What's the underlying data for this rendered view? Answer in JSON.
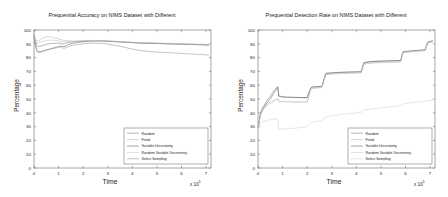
{
  "figure": {
    "background_color": "#ffffff",
    "panel_count": 2
  },
  "chart_data": [
    {
      "type": "line",
      "panel": "left",
      "title": "Prequential Accuracy on NIMS Dataset with Different\nBudgeting Strategies (Naive Bayes, 10% Budget)",
      "title_line1": "Prequential Accuracy on NIMS Dataset with Different",
      "title_line2": "Budgeting Strategies (Naive Bayes, 10% Budget)",
      "xlabel": "Time",
      "ylabel": "Percentage",
      "x_multiplier": "x 10",
      "x_exponent": "5",
      "xlim": [
        0,
        7.2
      ],
      "ylim": [
        0,
        100
      ],
      "xticks": [
        0,
        1,
        2,
        3,
        4,
        5,
        6,
        7
      ],
      "yticks": [
        0,
        10,
        20,
        30,
        40,
        50,
        60,
        70,
        80,
        90,
        100
      ],
      "grid": false,
      "legend_position": "lower right",
      "legend_labels": [
        "Random",
        "Fixed",
        "Variable Uncertainty",
        "Random Variable Uncertainty",
        "Select Sampling"
      ],
      "x": [
        0,
        0.05,
        0.1,
        0.15,
        0.2,
        0.3,
        0.4,
        0.5,
        0.6,
        0.7,
        0.8,
        0.9,
        1.0,
        1.1,
        1.2,
        1.3,
        1.4,
        1.5,
        1.6,
        1.8,
        2.0,
        2.2,
        2.4,
        2.6,
        2.8,
        3.0,
        3.2,
        3.4,
        3.6,
        3.8,
        4.0,
        4.2,
        4.4,
        4.6,
        4.8,
        5.0,
        5.2,
        5.4,
        5.6,
        5.8,
        6.0,
        6.2,
        6.4,
        6.6,
        6.8,
        7.0,
        7.1
      ],
      "series": [
        {
          "name": "Random",
          "color": "#8a8a8a",
          "values": [
            97,
            92,
            89,
            88,
            88,
            88.5,
            89,
            89.5,
            90,
            90.2,
            90.3,
            90.4,
            90.5,
            90.2,
            89.8,
            90.5,
            91,
            91.3,
            91.5,
            91.8,
            92,
            92.2,
            92.3,
            92.2,
            92,
            91.8,
            91.6,
            91.4,
            91.2,
            91,
            90.8,
            90.6,
            90.5,
            90.4,
            90.3,
            90.2,
            90.1,
            90,
            89.9,
            89.8,
            89.7,
            89.6,
            89.5,
            89.4,
            89.3,
            89.2,
            89.1
          ]
        },
        {
          "name": "Fixed",
          "color": "#bdbdbd",
          "values": [
            97,
            94,
            92.5,
            92,
            92.2,
            93.5,
            94.5,
            95,
            95.2,
            95,
            94.5,
            94,
            93.5,
            93,
            92.5,
            92.2,
            92,
            91.8,
            91.7,
            91.8,
            92,
            92.2,
            92.3,
            92.2,
            92.1,
            92,
            91.8,
            91.6,
            91.4,
            91.2,
            91,
            90.8,
            90.6,
            90.5,
            90.4,
            90.3,
            90.2,
            90.1,
            90,
            89.9,
            89.8,
            89.7,
            89.6,
            89.5,
            89.4,
            89.3,
            89.2
          ]
        },
        {
          "name": "Variable Uncertainty",
          "color": "#6e6e6e",
          "values": [
            96,
            90,
            86,
            84.5,
            84.2,
            84.5,
            85,
            85.5,
            86,
            86.5,
            87,
            87.5,
            88,
            88.3,
            87.8,
            88.5,
            89.5,
            90,
            90.5,
            91,
            91.5,
            91.8,
            92,
            92.1,
            92,
            91.9,
            91.7,
            91.5,
            91.3,
            91.1,
            90.9,
            90.7,
            90.6,
            90.5,
            90.4,
            90.3,
            90.2,
            90.1,
            90,
            89.9,
            89.8,
            89.7,
            89.6,
            89.5,
            89.4,
            89.3,
            89.2
          ]
        },
        {
          "name": "Random Variable Uncertainty",
          "color": "#c9c9c9",
          "values": [
            97,
            93,
            91,
            90.5,
            90.8,
            91.5,
            92,
            92.3,
            92.5,
            92.6,
            92.5,
            92.4,
            92.2,
            91.8,
            91.2,
            91.5,
            91.8,
            92,
            92.1,
            92.2,
            92.3,
            92.4,
            92.4,
            92.3,
            92.2,
            92.1,
            92,
            91.8,
            91.6,
            91.4,
            91.2,
            91,
            90.9,
            90.8,
            90.7,
            90.6,
            90.5,
            90.4,
            90.3,
            90.2,
            90.1,
            90,
            89.9,
            89.8,
            89.7,
            89.6,
            89.5
          ]
        },
        {
          "name": "Select Sampling",
          "color": "#9e9e9e",
          "values": [
            96,
            90,
            85.5,
            84,
            83.8,
            84.2,
            84.8,
            85.3,
            85.8,
            86.2,
            86.6,
            87,
            87.4,
            87.8,
            86.5,
            87.2,
            88,
            88.5,
            89,
            89.5,
            90,
            90.3,
            90.5,
            90.4,
            90.2,
            89.8,
            89.2,
            88.5,
            87.8,
            87,
            86.2,
            85.5,
            85,
            84.6,
            84.3,
            84,
            83.8,
            83.6,
            83.4,
            83.2,
            83,
            82.8,
            82.6,
            82.4,
            82.2,
            82,
            81.9
          ]
        }
      ]
    },
    {
      "type": "line",
      "panel": "right",
      "title": "Prequential Detection Rate on NIMS Dataset with Different\nBudgeting Strategies (Naive Bayes, 10% Budget)",
      "title_line1": "Prequential Detection Rate on NIMS Dataset with Different",
      "title_line2": "Budgeting Strategies (Naive Bayes, 10% Budget)",
      "xlabel": "Time",
      "ylabel": "Percentage",
      "x_multiplier": "x 10",
      "x_exponent": "5",
      "xlim": [
        0,
        7.2
      ],
      "ylim": [
        0,
        100
      ],
      "xticks": [
        0,
        1,
        2,
        3,
        4,
        5,
        6,
        7
      ],
      "yticks": [
        0,
        10,
        20,
        30,
        40,
        50,
        60,
        70,
        80,
        90,
        100
      ],
      "grid": false,
      "legend_position": "lower right",
      "legend_labels": [
        "Random",
        "Fixed",
        "Variable Uncertainty",
        "Random Variable Uncertainty",
        "Select Sampling"
      ],
      "x": [
        0,
        0.1,
        0.2,
        0.3,
        0.4,
        0.5,
        0.6,
        0.7,
        0.8,
        0.85,
        0.9,
        1.0,
        1.2,
        1.4,
        1.6,
        1.8,
        2.0,
        2.15,
        2.2,
        2.4,
        2.6,
        2.75,
        2.8,
        3.0,
        3.2,
        3.4,
        3.6,
        3.8,
        4.0,
        4.2,
        4.3,
        4.4,
        4.6,
        4.8,
        5.0,
        5.2,
        5.4,
        5.6,
        5.8,
        5.9,
        6.0,
        6.2,
        6.4,
        6.6,
        6.8,
        6.9,
        7.0,
        7.1
      ],
      "series": [
        {
          "name": "Random",
          "color": "#8a8a8a",
          "values": [
            29,
            40,
            44,
            47,
            50,
            52,
            55,
            57,
            59,
            52,
            52,
            51.5,
            51.3,
            51.2,
            51.1,
            51,
            51,
            58,
            58.5,
            58.8,
            59,
            68,
            68.5,
            68.8,
            69,
            69.2,
            69.3,
            69.4,
            69.5,
            69.6,
            76,
            76.5,
            77,
            77.2,
            77.4,
            77.5,
            77.6,
            77.7,
            77.8,
            84,
            84.3,
            84.6,
            84.9,
            85.2,
            85.5,
            91,
            91.5,
            92
          ]
        },
        {
          "name": "Fixed",
          "color": "#bdbdbd",
          "values": [
            29,
            38,
            42,
            44,
            46,
            47,
            48,
            49,
            50,
            48,
            48,
            48,
            48,
            47.8,
            47.8,
            47.8,
            47.8,
            57,
            57.5,
            58,
            58.3,
            67,
            67.5,
            68,
            68.3,
            68.5,
            68.6,
            68.7,
            68.8,
            68.9,
            75,
            75.5,
            76,
            76.2,
            76.4,
            76.5,
            76.6,
            76.7,
            76.8,
            83.5,
            83.8,
            84.1,
            84.4,
            84.7,
            85,
            90.5,
            91,
            91.5
          ]
        },
        {
          "name": "Variable Uncertainty",
          "color": "#6e6e6e",
          "values": [
            29,
            39,
            43,
            45.5,
            48,
            50,
            53,
            56,
            58.5,
            52,
            52,
            51.5,
            51.3,
            51.2,
            51.1,
            51,
            51,
            58.2,
            58.7,
            59,
            59.2,
            68.2,
            68.7,
            69,
            69.2,
            69.4,
            69.5,
            69.6,
            69.7,
            69.8,
            76.2,
            76.7,
            77.1,
            77.3,
            77.5,
            77.6,
            77.7,
            77.8,
            77.9,
            84.2,
            84.5,
            84.8,
            85.1,
            85.4,
            85.7,
            91.2,
            91.7,
            92.2
          ]
        },
        {
          "name": "Random Variable Uncertainty",
          "color": "#c9c9c9",
          "values": [
            29,
            38.5,
            42.5,
            44.5,
            46.5,
            47.5,
            48.5,
            49.5,
            50.5,
            48.5,
            48.5,
            48.3,
            48.2,
            48,
            48,
            48,
            48,
            57.3,
            57.8,
            58.2,
            58.5,
            67.3,
            67.8,
            68.2,
            68.5,
            68.7,
            68.8,
            68.9,
            69,
            69.1,
            75.3,
            75.8,
            76.2,
            76.4,
            76.6,
            76.7,
            76.8,
            76.9,
            77,
            83.7,
            84,
            84.3,
            84.6,
            84.9,
            85.2,
            90.7,
            91.2,
            91.7
          ]
        },
        {
          "name": "Select Sampling",
          "color": "#d4d4d4",
          "values": [
            29,
            32,
            33.5,
            34,
            34.5,
            35,
            35.3,
            35.5,
            35.7,
            28,
            28,
            28.2,
            28.5,
            28.8,
            29,
            29.5,
            30,
            33,
            33.3,
            33.8,
            34.2,
            37,
            37.3,
            37.8,
            38.3,
            38.8,
            39.2,
            39.6,
            40,
            40.4,
            42,
            42.4,
            42.8,
            43.2,
            43.6,
            44,
            44.4,
            44.8,
            45.2,
            46.5,
            46.8,
            47.2,
            47.6,
            48,
            48.3,
            48.8,
            49,
            49.2
          ]
        }
      ]
    }
  ]
}
